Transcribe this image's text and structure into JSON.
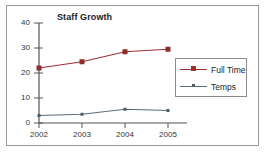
{
  "chart_data": {
    "type": "line",
    "title": "Staff Growth",
    "xlabel": "",
    "ylabel": "",
    "categories": [
      "2002",
      "2003",
      "2004",
      "2005"
    ],
    "yticks": [
      0,
      10,
      20,
      30,
      40
    ],
    "ylim": [
      0,
      40
    ],
    "grid": false,
    "legend_position": "right-inside",
    "series": [
      {
        "name": "Full Time",
        "color": "#9e3232",
        "marker": "square",
        "values": [
          22,
          24.5,
          28.5,
          29.5
        ]
      },
      {
        "name": "Temps",
        "color": "#5b6b7b",
        "marker": "small-square",
        "values": [
          3,
          3.5,
          5.5,
          5
        ]
      }
    ]
  },
  "axis": {
    "tick_labels_y": [
      "40",
      "30",
      "20",
      "10",
      "0"
    ],
    "tick_labels_x": [
      "2002",
      "2003",
      "2004",
      "2005"
    ]
  },
  "legend": {
    "entries": [
      {
        "label": "Full Time"
      },
      {
        "label": "Temps"
      }
    ]
  },
  "colors": {
    "full_time": "#9e3232",
    "temps": "#5b6b7b",
    "axis": "#555555",
    "border": "#9a9a9a"
  }
}
